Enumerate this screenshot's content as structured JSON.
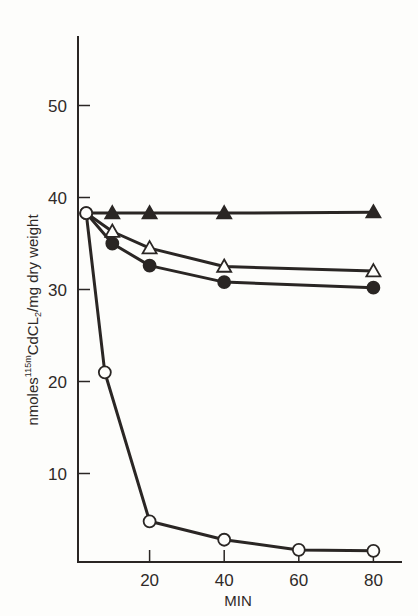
{
  "chart_data": {
    "type": "line",
    "title": "",
    "xlabel": "MIN",
    "ylabel": "nmoles 115mCdCL2/mg dry weight",
    "ylabel_parts": {
      "pre": "nmoles",
      "sup": "115m",
      "mid": "CdCL",
      "sub": "2",
      "post": "/mg dry weight"
    },
    "xlim": [
      0,
      88
    ],
    "ylim": [
      0,
      57
    ],
    "x_ticks": [
      20,
      40,
      60,
      80
    ],
    "y_ticks": [
      10,
      20,
      30,
      40,
      50
    ],
    "grid": false,
    "legend": null,
    "series": [
      {
        "name": "filled-triangle",
        "marker": "triangle-filled",
        "x": [
          3,
          10,
          20,
          40,
          80
        ],
        "y": [
          38.3,
          38.3,
          38.3,
          38.3,
          38.4
        ]
      },
      {
        "name": "open-triangle",
        "marker": "triangle-open",
        "x": [
          3,
          10,
          20,
          40,
          80
        ],
        "y": [
          38.3,
          36.3,
          34.5,
          32.5,
          32.0
        ]
      },
      {
        "name": "filled-circle",
        "marker": "circle-filled",
        "x": [
          3,
          10,
          20,
          40,
          80
        ],
        "y": [
          38.3,
          35.0,
          32.6,
          30.8,
          30.2
        ]
      },
      {
        "name": "open-circle",
        "marker": "circle-open",
        "x": [
          3,
          8,
          20,
          40,
          60,
          80
        ],
        "y": [
          38.3,
          21.0,
          4.8,
          2.8,
          1.7,
          1.6
        ]
      }
    ]
  },
  "colors": {
    "ink": "#2a2624",
    "background": "#fdfdfb"
  }
}
